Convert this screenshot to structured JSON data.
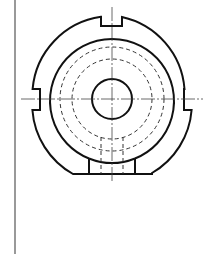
{
  "drawing": {
    "type": "engineering-drawing",
    "view": "front-view",
    "colors": {
      "background": "#ffffff",
      "outline": "#111111",
      "hidden_line": "#333333",
      "center_line": "#444444",
      "frame_line": "#555555"
    },
    "center": [
      112,
      99
    ],
    "features": {
      "outer_profile_radius": 80,
      "inner_circle_radius": 62,
      "hidden_circle_radii": [
        52,
        40
      ],
      "center_hole_radius": 20,
      "top_notch": {
        "x1": 101,
        "x2": 122,
        "depth_y": 26
      },
      "left_notch": {
        "x": 40,
        "y1": 89,
        "y2": 110
      },
      "right_notch": {
        "x": 184,
        "y1": 89,
        "y2": 110
      },
      "bottom_flat_y": 174,
      "bottom_slot": {
        "x1": 89,
        "x2": 135
      },
      "hidden_slot_lines_x": [
        101,
        123
      ]
    }
  }
}
